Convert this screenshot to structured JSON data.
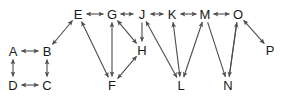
{
  "diagram": {
    "type": "directed-graph",
    "title": "",
    "background_color": "#ffffff",
    "node_color": "#1a1a1a",
    "edge_color": "#4d4d4d",
    "nodes": [
      {
        "id": "A",
        "label": "A",
        "x": 13,
        "y": 51
      },
      {
        "id": "B",
        "label": "B",
        "x": 47,
        "y": 51
      },
      {
        "id": "C",
        "label": "C",
        "x": 47,
        "y": 85
      },
      {
        "id": "D",
        "label": "D",
        "x": 13,
        "y": 85
      },
      {
        "id": "E",
        "label": "E",
        "x": 78,
        "y": 14
      },
      {
        "id": "F",
        "label": "F",
        "x": 112,
        "y": 85
      },
      {
        "id": "G",
        "label": "G",
        "x": 112,
        "y": 14
      },
      {
        "id": "H",
        "label": "H",
        "x": 142,
        "y": 50
      },
      {
        "id": "J",
        "label": "J",
        "x": 142,
        "y": 14
      },
      {
        "id": "K",
        "label": "K",
        "x": 172,
        "y": 14
      },
      {
        "id": "L",
        "label": "L",
        "x": 181,
        "y": 85
      },
      {
        "id": "M",
        "label": "M",
        "x": 205,
        "y": 14
      },
      {
        "id": "N",
        "label": "N",
        "x": 228,
        "y": 85
      },
      {
        "id": "O",
        "label": "O",
        "x": 238,
        "y": 14
      },
      {
        "id": "P",
        "label": "P",
        "x": 270,
        "y": 50
      }
    ],
    "edges": [
      {
        "from": "A",
        "to": "B",
        "direction": "both"
      },
      {
        "from": "A",
        "to": "D",
        "direction": "both"
      },
      {
        "from": "D",
        "to": "C",
        "direction": "both"
      },
      {
        "from": "C",
        "to": "B",
        "direction": "both"
      },
      {
        "from": "B",
        "to": "E",
        "direction": "both"
      },
      {
        "from": "E",
        "to": "G",
        "direction": "both"
      },
      {
        "from": "G",
        "to": "J",
        "direction": "both"
      },
      {
        "from": "J",
        "to": "K",
        "direction": "both"
      },
      {
        "from": "K",
        "to": "M",
        "direction": "both"
      },
      {
        "from": "M",
        "to": "O",
        "direction": "both"
      },
      {
        "from": "E",
        "to": "F",
        "direction": "both"
      },
      {
        "from": "G",
        "to": "F",
        "direction": "both"
      },
      {
        "from": "H",
        "to": "F",
        "direction": "both"
      },
      {
        "from": "H",
        "to": "G",
        "direction": "both"
      },
      {
        "from": "J",
        "to": "H",
        "direction": "forward"
      },
      {
        "from": "J",
        "to": "L",
        "direction": "both"
      },
      {
        "from": "K",
        "to": "L",
        "direction": "both"
      },
      {
        "from": "L",
        "to": "M",
        "direction": "both"
      },
      {
        "from": "M",
        "to": "N",
        "direction": "forward"
      },
      {
        "from": "O",
        "to": "N",
        "direction": "forward"
      },
      {
        "from": "N",
        "to": "O",
        "direction": "forward"
      },
      {
        "from": "O",
        "to": "P",
        "direction": "both"
      }
    ]
  }
}
